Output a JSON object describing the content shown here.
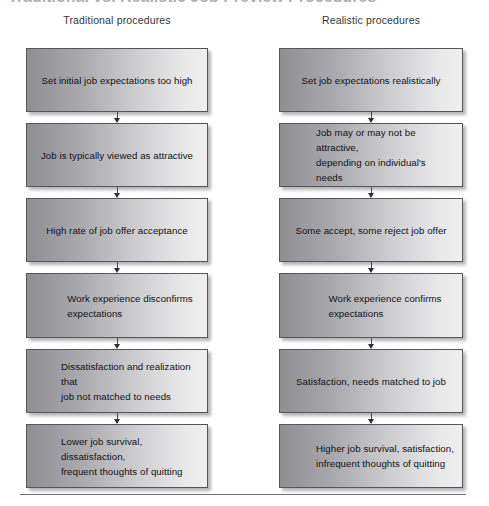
{
  "figure": {
    "title_fragment": "Traditional vs. Realistic Job Preview Procedures",
    "bottom_rule": true
  },
  "columns": [
    {
      "id": "traditional",
      "heading": "Traditional procedures",
      "steps": [
        {
          "text": "Set initial job expectations too high",
          "lines": 1
        },
        {
          "text": "Job is typically viewed as attractive",
          "lines": 1
        },
        {
          "text": "High rate of job offer acceptance",
          "lines": 1
        },
        {
          "text": "Work experience disconfirms\nexpectations",
          "lines": 2
        },
        {
          "text": "Dissatisfaction and realization that\njob not matched to needs",
          "lines": 2
        },
        {
          "text": "Lower job survival, dissatisfaction,\nfrequent thoughts of quitting",
          "lines": 2
        }
      ]
    },
    {
      "id": "realistic",
      "heading": "Realistic procedures",
      "steps": [
        {
          "text": "Set job expectations realistically",
          "lines": 1
        },
        {
          "text": "Job may or may not be attractive,\ndepending on individual's needs",
          "lines": 2
        },
        {
          "text": "Some accept, some reject job offer",
          "lines": 1
        },
        {
          "text": "Work experience confirms\nexpectations",
          "lines": 2
        },
        {
          "text": "Satisfaction, needs matched to job",
          "lines": 1
        },
        {
          "text": "Higher job survival, satisfaction,\ninfrequent thoughts of quitting",
          "lines": 2
        }
      ]
    }
  ],
  "colors": {
    "box_gradient_start": "#8f8f93",
    "box_gradient_end": "#efefef",
    "box_border": "#55555a",
    "arrow": "#2d2d33",
    "text": "#111114",
    "rule": "#6f6f75"
  },
  "chart_data": {
    "type": "diagram",
    "title": "Traditional vs. Realistic Job Preview Procedures",
    "diagram_kind": "parallel-flowchart",
    "flow_direction": "top-to-bottom",
    "columns": 2,
    "steps_per_column": 6
  }
}
